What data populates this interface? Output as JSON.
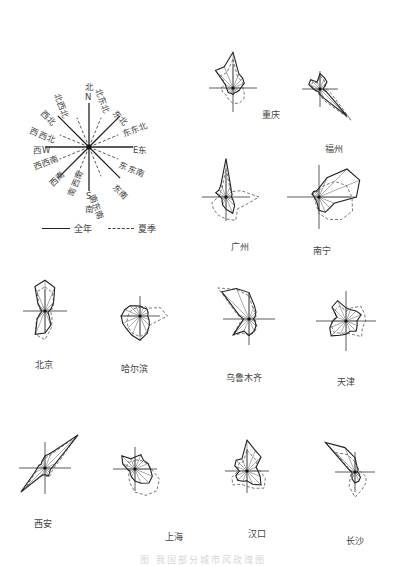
{
  "figure": {
    "caption": "图 我国部分城市风玫瑰图",
    "directions_order": [
      "北",
      "北东北",
      "东北",
      "东东北",
      "东",
      "东东南",
      "东南",
      "南东南",
      "南",
      "南西南",
      "西南",
      "西西南",
      "西",
      "西西北",
      "西北",
      "北西北"
    ]
  },
  "compass": {
    "center": [
      89,
      147
    ],
    "labels": [
      {
        "text": "北",
        "x": 85,
        "y": 80
      },
      {
        "text": "N",
        "x": 85,
        "y": 92
      },
      {
        "text": "北东北",
        "x": 104,
        "y": 86,
        "rot": 68
      },
      {
        "text": "东北",
        "x": 119,
        "y": 107,
        "rot": 45
      },
      {
        "text": "东东北",
        "x": 120,
        "y": 128,
        "rot": -22
      },
      {
        "text": "E东",
        "x": 133,
        "y": 143
      },
      {
        "text": "东东南",
        "x": 122,
        "y": 158,
        "rot": 22
      },
      {
        "text": "东南",
        "x": 119,
        "y": 181,
        "rot": 45
      },
      {
        "text": "南东南",
        "x": 98,
        "y": 192,
        "rot": 68
      },
      {
        "text": "S",
        "x": 86,
        "y": 191
      },
      {
        "text": "南",
        "x": 85,
        "y": 202
      },
      {
        "text": "南西南",
        "x": 64,
        "y": 193,
        "rot": -68
      },
      {
        "text": "西南",
        "x": 46,
        "y": 180,
        "rot": -45
      },
      {
        "text": "西西南",
        "x": 31,
        "y": 161,
        "rot": -22
      },
      {
        "text": "西W",
        "x": 33,
        "y": 143
      },
      {
        "text": "西西北",
        "x": 33,
        "y": 124,
        "rot": 22
      },
      {
        "text": "西北",
        "x": 47,
        "y": 107,
        "rot": 45
      },
      {
        "text": "北西北",
        "x": 63,
        "y": 91,
        "rot": 68
      }
    ],
    "solid_dirs": [
      0,
      2,
      4,
      6,
      8,
      10,
      12,
      14
    ],
    "dashed_dirs": [
      1,
      3,
      5,
      7,
      9,
      11,
      13,
      15
    ],
    "ray_length": 44
  },
  "legend": {
    "annual_label": "全年",
    "summer_label": "夏季"
  },
  "chart_data": {
    "type": "wind-rose",
    "directions": [
      "N",
      "NNE",
      "NE",
      "ENE",
      "E",
      "ESE",
      "SE",
      "SSE",
      "S",
      "SSW",
      "SW",
      "WSW",
      "W",
      "WNW",
      "NW",
      "NNW"
    ],
    "series_names": [
      "全年",
      "夏季"
    ],
    "cities": [
      {
        "name": "重庆",
        "center": [
          233,
          88
        ],
        "label_pos": [
          262,
          108
        ],
        "axis": 24,
        "annual": [
          65,
          28,
          25,
          22,
          14,
          12,
          10,
          9,
          12,
          10,
          12,
          11,
          12,
          15,
          45,
          42
        ],
        "summer": [
          52,
          22,
          20,
          20,
          18,
          22,
          28,
          30,
          28,
          22,
          18,
          20,
          22,
          14,
          32,
          30
        ]
      },
      {
        "name": "福州",
        "center": [
          320,
          89
        ],
        "label_pos": [
          325,
          142
        ],
        "axis": 18,
        "annual": [
          28,
          22,
          18,
          8,
          6,
          12,
          70,
          18,
          10,
          6,
          6,
          8,
          12,
          22,
          24,
          14
        ],
        "summer": [
          24,
          18,
          14,
          10,
          12,
          22,
          80,
          24,
          12,
          8,
          6,
          8,
          10,
          18,
          18,
          12
        ]
      },
      {
        "name": "广州",
        "center": [
          226,
          197
        ],
        "label_pos": [
          231,
          240
        ],
        "axis": 24,
        "annual": [
          70,
          22,
          14,
          12,
          10,
          14,
          22,
          32,
          22,
          16,
          10,
          8,
          10,
          20,
          18,
          24
        ],
        "summer": [
          52,
          18,
          14,
          30,
          60,
          38,
          30,
          46,
          40,
          36,
          32,
          28,
          14,
          12,
          14,
          18
        ]
      },
      {
        "name": "南宁",
        "center": [
          319,
          197
        ],
        "label_pos": [
          313,
          244
        ],
        "axis": 32,
        "annual": [
          16,
          38,
          72,
          80,
          68,
          30,
          28,
          30,
          24,
          10,
          8,
          8,
          8,
          14,
          14,
          12
        ],
        "summer": [
          12,
          22,
          40,
          54,
          60,
          66,
          58,
          44,
          30,
          14,
          10,
          8,
          10,
          12,
          12,
          10
        ]
      },
      {
        "name": "北京",
        "center": [
          45,
          311
        ],
        "label_pos": [
          35,
          358
        ],
        "axis": 22,
        "annual": [
          56,
          46,
          22,
          12,
          8,
          6,
          10,
          28,
          40,
          46,
          20,
          8,
          6,
          8,
          18,
          48
        ],
        "summer": [
          44,
          36,
          22,
          16,
          10,
          12,
          18,
          32,
          52,
          46,
          22,
          10,
          8,
          10,
          16,
          38
        ]
      },
      {
        "name": "哈尔滨",
        "center": [
          140,
          316
        ],
        "label_pos": [
          121,
          362
        ],
        "axis": 20,
        "annual": [
          18,
          16,
          18,
          16,
          14,
          18,
          24,
          34,
          44,
          38,
          34,
          34,
          34,
          30,
          26,
          20
        ],
        "summer": [
          16,
          20,
          20,
          40,
          50,
          30,
          24,
          32,
          38,
          34,
          30,
          26,
          22,
          20,
          18,
          16
        ]
      },
      {
        "name": "乌鲁木齐",
        "center": [
          249,
          319
        ],
        "label_pos": [
          226,
          371
        ],
        "axis": 26,
        "annual": [
          48,
          26,
          18,
          12,
          8,
          12,
          18,
          24,
          30,
          24,
          40,
          14,
          10,
          20,
          70,
          60
        ],
        "summer": [
          42,
          20,
          16,
          14,
          10,
          14,
          20,
          26,
          30,
          28,
          42,
          18,
          12,
          24,
          80,
          58
        ]
      },
      {
        "name": "天津",
        "center": [
          346,
          321
        ],
        "label_pos": [
          337,
          375
        ],
        "axis": 30,
        "annual": [
          24,
          22,
          26,
          30,
          20,
          22,
          26,
          20,
          24,
          28,
          38,
          32,
          24,
          18,
          36,
          40
        ],
        "summer": [
          18,
          26,
          38,
          36,
          36,
          32,
          40,
          26,
          22,
          24,
          30,
          28,
          26,
          20,
          28,
          30
        ]
      },
      {
        "name": "西安",
        "center": [
          45,
          468
        ],
        "label_pos": [
          34,
          517
        ],
        "axis": 26,
        "annual": [
          22,
          30,
          85,
          20,
          12,
          10,
          12,
          16,
          12,
          14,
          62,
          20,
          14,
          12,
          10,
          14
        ],
        "summer": [
          18,
          26,
          82,
          26,
          16,
          14,
          16,
          18,
          14,
          16,
          48,
          18,
          14,
          12,
          10,
          12
        ]
      },
      {
        "name": "上海",
        "center": [
          135,
          469
        ],
        "label_pos": [
          165,
          530
        ],
        "axis": 22,
        "annual": [
          22,
          28,
          22,
          26,
          28,
          34,
          36,
          28,
          22,
          16,
          12,
          10,
          14,
          24,
          34,
          20
        ],
        "summer": [
          16,
          18,
          20,
          24,
          30,
          48,
          56,
          52,
          42,
          26,
          16,
          12,
          14,
          16,
          18,
          14
        ]
      },
      {
        "name": "汉口",
        "center": [
          247,
          471
        ],
        "label_pos": [
          248,
          527
        ],
        "axis": 22,
        "annual": [
          56,
          40,
          36,
          18,
          20,
          26,
          36,
          26,
          18,
          20,
          24,
          22,
          14,
          24,
          28,
          24
        ],
        "summer": [
          38,
          28,
          26,
          18,
          24,
          36,
          44,
          34,
          28,
          26,
          36,
          30,
          16,
          18,
          20,
          18
        ]
      },
      {
        "name": "长沙",
        "center": [
          355,
          472
        ],
        "label_pos": [
          346,
          534
        ],
        "axis": 20,
        "annual": [
          26,
          10,
          8,
          6,
          4,
          8,
          14,
          18,
          20,
          14,
          8,
          6,
          6,
          12,
          76,
          48
        ],
        "summer": [
          18,
          10,
          8,
          8,
          10,
          22,
          28,
          34,
          46,
          28,
          12,
          8,
          6,
          10,
          50,
          34
        ]
      }
    ]
  }
}
